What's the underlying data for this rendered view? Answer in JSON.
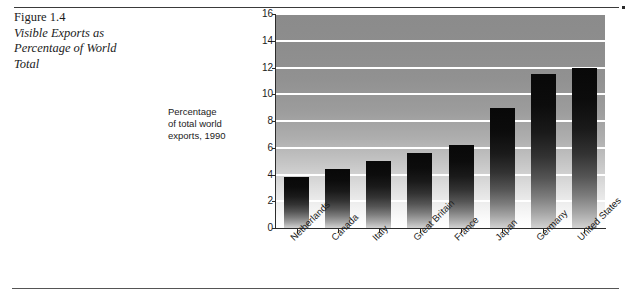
{
  "figure": {
    "number": "Figure 1.4",
    "title_line_1": "Visible Exports as",
    "title_line_2": "Percentage of World",
    "title_line_3": "Total"
  },
  "axis_caption": {
    "line_1": "Percentage",
    "line_2": "of total world",
    "line_3": "exports, 1990"
  },
  "chart_data": {
    "type": "bar",
    "title": "Visible Exports as Percentage of World Total",
    "xlabel": "",
    "ylabel": "Percentage of total world exports, 1990",
    "ylim": [
      0,
      16
    ],
    "ytick_labels": [
      "0",
      "2",
      "4",
      "6",
      "8",
      "10",
      "12",
      "14",
      "16"
    ],
    "yticks": [
      0,
      2,
      4,
      6,
      8,
      10,
      12,
      14,
      16
    ],
    "grid": true,
    "legend": "none",
    "categories": [
      "Netherlands",
      "Canada",
      "Italy",
      "Great Britain",
      "France",
      "Japan",
      "Germany",
      "United States"
    ],
    "values": [
      3.8,
      4.4,
      5.0,
      5.6,
      6.2,
      9.0,
      11.5,
      12.0
    ]
  },
  "colors": {
    "bar_top": "#080808",
    "bar_bottom": "#d2d2d2",
    "plot_background_top": "#8b8b8b",
    "plot_background_bottom": "#ffffff",
    "gridline": "#ffffff",
    "axis": "#2b2b2b",
    "text": "#1b1b1b"
  }
}
